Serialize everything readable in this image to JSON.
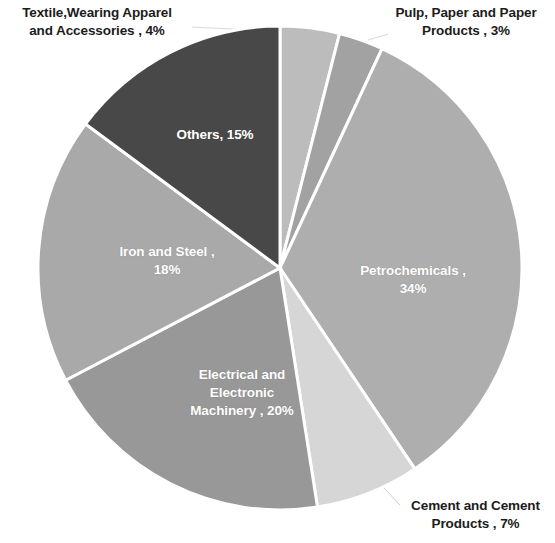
{
  "chart_data": {
    "type": "pie",
    "title": "",
    "subtitle": "",
    "xlabel": "",
    "ylabel": "",
    "units": "percent",
    "start_angle_deg": 0,
    "direction": "clockwise",
    "center": {
      "x": 280,
      "y": 268
    },
    "radius": 242,
    "legend_position": "none",
    "grid": false,
    "categories": [
      "Textile,Wearing Apparel and Accessories",
      "Pulp, Paper and Paper Products",
      "Petrochemicals",
      "Cement and Cement Products",
      "Electrical and Electronic Machinery",
      "Iron and Steel",
      "Others"
    ],
    "values": [
      4,
      3,
      34,
      7,
      20,
      18,
      15
    ],
    "colors": [
      "#bcbcbc",
      "#a2a2a2",
      "#aeaeae",
      "#d6d6d6",
      "#989898",
      "#a9a9a9",
      "#484848"
    ],
    "slice_border_color": "#ffffff",
    "slices": [
      {
        "label": "Textile,Wearing Apparel and Accessories",
        "value": 4,
        "display": "Textile,Wearing Apparel and Accessories , 4%",
        "color": "#bcbcbc",
        "label_placement": "outside"
      },
      {
        "label": "Pulp, Paper and Paper Products",
        "value": 3,
        "display": "Pulp, Paper and Paper Products , 3%",
        "color": "#a2a2a2",
        "label_placement": "outside"
      },
      {
        "label": "Petrochemicals",
        "value": 34,
        "display": "Petrochemicals , 34%",
        "color": "#aeaeae",
        "label_placement": "inside"
      },
      {
        "label": "Cement and Cement Products",
        "value": 7,
        "display": "Cement and Cement Products , 7%",
        "color": "#d6d6d6",
        "label_placement": "outside"
      },
      {
        "label": "Electrical and Electronic Machinery",
        "value": 20,
        "display": "Electrical and Electronic Machinery , 20%",
        "color": "#989898",
        "label_placement": "inside"
      },
      {
        "label": "Iron and Steel",
        "value": 18,
        "display": "Iron and Steel , 18%",
        "color": "#a9a9a9",
        "label_placement": "inside"
      },
      {
        "label": "Others",
        "value": 15,
        "display": "Others, 15%",
        "color": "#484848",
        "label_placement": "inside"
      }
    ]
  },
  "labels": {
    "textile": {
      "line1": "Textile,Wearing Apparel",
      "line2": "and Accessories , 4%"
    },
    "pulp": {
      "line1": "Pulp, Paper and Paper",
      "line2": "Products , 3%"
    },
    "cement": {
      "line1": "Cement and Cement",
      "line2": "Products , 7%"
    },
    "others": {
      "line1": "Others, 15%"
    },
    "petro": {
      "line1": "Petrochemicals ,",
      "line2": "34%"
    },
    "iron": {
      "line1": "Iron and Steel  ,",
      "line2": "18%"
    },
    "elec": {
      "line1": "Electrical and",
      "line2": "Electronic",
      "line3": "Machinery , 20%"
    }
  }
}
